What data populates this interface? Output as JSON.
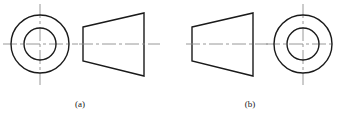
{
  "figure": {
    "width": 338,
    "height": 127,
    "background_color": "#ffffff",
    "object_line_color": "#1a1a1a",
    "center_line_color": "#8c8c8c",
    "object_line_width": 1.4,
    "center_line_width": 0.9,
    "center_line_dash": "14,3,3,3"
  },
  "captions": {
    "a": "(a)",
    "b": "(b)"
  },
  "views": [
    {
      "id": "a",
      "label": "(a)",
      "arrangement": "circular-view-left, trapezoid-view-right",
      "circle_view": {
        "name": "end-view-circles",
        "center_x": 40,
        "center_y": 44,
        "outer_radius": 29,
        "inner_radius": 16,
        "vertical_centerline": {
          "x": 40,
          "y1": 4,
          "y2": 85
        },
        "horizontal_centerline": {
          "y": 44,
          "x1": 3,
          "x2": 78
        }
      },
      "trapezoid_view": {
        "name": "side-view-trapezoid",
        "points": "83,27 144,13 144,76 83,61",
        "left_edge": {
          "x": 83,
          "y1": 27,
          "y2": 61
        },
        "right_edge": {
          "x": 144,
          "y1": 13,
          "y2": 76
        },
        "axis_centerline": {
          "y": 44,
          "x1": 79,
          "x2": 160
        }
      }
    },
    {
      "id": "b",
      "label": "(b)",
      "arrangement": "trapezoid-view-left, circular-view-right",
      "trapezoid_view": {
        "name": "side-view-trapezoid",
        "points": "192,27 253,13 253,76 192,61",
        "left_edge": {
          "x": 192,
          "y1": 27,
          "y2": 61
        },
        "right_edge": {
          "x": 253,
          "y1": 13,
          "y2": 76
        },
        "axis_centerline": {
          "y": 44,
          "x1": 186,
          "x2": 268
        }
      },
      "circle_view": {
        "name": "end-view-circles",
        "center_x": 303,
        "center_y": 44,
        "outer_radius": 29,
        "inner_radius": 16,
        "vertical_centerline": {
          "x": 303,
          "y1": 4,
          "y2": 85
        },
        "horizontal_centerline": {
          "y": 44,
          "x1": 266,
          "x2": 335
        }
      }
    }
  ]
}
